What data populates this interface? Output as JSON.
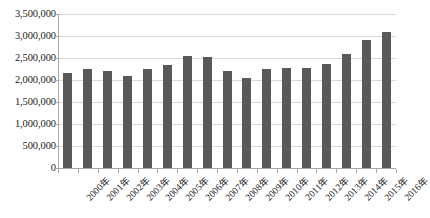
{
  "chart_data": {
    "type": "bar",
    "title": "",
    "xlabel": "",
    "ylabel": "",
    "ylim": [
      0,
      3500000
    ],
    "ytick_step": 500000,
    "grid": true,
    "legend": "none",
    "bar_color": "#595959",
    "gridline_color": "#d9d9d9",
    "axis_color": "#a6a6a6",
    "ytick_labels": [
      "3,500,000",
      "3,000,000",
      "2,500,000",
      "2,000,000",
      "1,500,000",
      "1,000,000",
      "500,000",
      "0"
    ],
    "ytick_values": [
      3500000,
      3000000,
      2500000,
      2000000,
      1500000,
      1000000,
      500000,
      0
    ],
    "categories": [
      "2000年",
      "2001年",
      "2002年",
      "2003年",
      "2004年",
      "2005年",
      "2006年",
      "2007年",
      "2008年",
      "2009年",
      "2010年",
      "2011年",
      "2012年",
      "2013年",
      "2014年",
      "2015年",
      "2016年"
    ],
    "values": [
      2160000,
      2240000,
      2215000,
      2090000,
      2255000,
      2340000,
      2535000,
      2530000,
      2200000,
      2040000,
      2250000,
      2280000,
      2265000,
      2365000,
      2580000,
      2900000,
      3100000
    ]
  }
}
